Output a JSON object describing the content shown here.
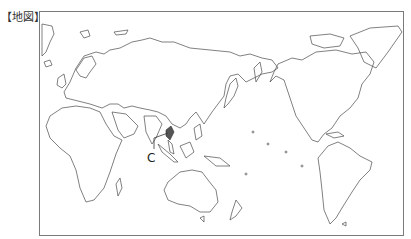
{
  "header": {
    "title": "【地図】"
  },
  "map": {
    "projection": "pacific-centered world map",
    "labels": [
      {
        "id": "C",
        "text": "C",
        "points_to": "Malay Peninsula / Thailand region"
      }
    ],
    "colors": {
      "outline": "#4a4a4a",
      "frame": "#7a7a7a",
      "background": "#ffffff",
      "highlight": "#555555"
    }
  }
}
